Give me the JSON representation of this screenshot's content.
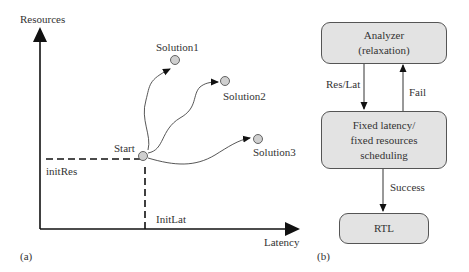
{
  "panel_a": {
    "caption": "(a)",
    "y_axis_label": "Resources",
    "x_axis_label": "Latency",
    "init_res_label": "initRes",
    "init_lat_label": "InitLat",
    "start_label": "Start",
    "solutions": [
      {
        "label": "Solution1"
      },
      {
        "label": "Solution2"
      },
      {
        "label": "Solution3"
      }
    ]
  },
  "panel_b": {
    "caption": "(b)",
    "analyzer": {
      "line1": "Analyzer",
      "line2": "(relaxation)"
    },
    "scheduler": {
      "line1": "Fixed latency/",
      "line2": "fixed resources",
      "line3": "scheduling"
    },
    "rtl": {
      "label": "RTL"
    },
    "edges": {
      "res_lat": "Res/Lat",
      "fail": "Fail",
      "success": "Success"
    }
  },
  "colors": {
    "node_fill": "#cfcfcf",
    "box_fill": "#e3e3e3",
    "line": "#111111"
  }
}
